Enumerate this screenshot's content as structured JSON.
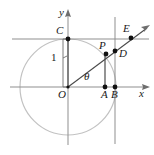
{
  "figure": {
    "kind": "unit-circle-trigonometry-diagram",
    "width": 154,
    "height": 155,
    "background_color": "#ffffff",
    "stroke_color": "#3b3b3b",
    "circle_color": "#bdbdbd",
    "guide_color": "#8c8c8c",
    "point_color": "#1a1a1a"
  },
  "axes": {
    "x_label": "x",
    "y_label": "y",
    "origin_label": "O",
    "origin": {
      "x": 68,
      "y": 87
    },
    "x_axis_y": 87,
    "y_axis_x": 68,
    "x_axis_arrow_tip": {
      "x": 150,
      "y": 87
    },
    "y_axis_arrow_tip": {
      "x": 68,
      "y": 9
    }
  },
  "circle": {
    "center": {
      "x": 68,
      "y": 87
    },
    "radius": 48,
    "radius_label": "1"
  },
  "measure": {
    "label": "1",
    "label_pos": {
      "x": 51,
      "y": 53
    },
    "bracket_x": 63,
    "bracket_top_y": 39,
    "bracket_bottom_y": 87
  },
  "angle": {
    "label": "θ",
    "label_pos": {
      "x": 84,
      "y": 73
    },
    "degrees": 45
  },
  "points": [
    {
      "name": "C",
      "label": "C",
      "x": 68,
      "y": 39,
      "label_pos": {
        "x": 57,
        "y": 26
      }
    },
    {
      "name": "E",
      "label": "E",
      "x": 131,
      "y": 37,
      "label_pos": {
        "x": 124,
        "y": 24
      }
    },
    {
      "name": "P",
      "label": "P",
      "x": 106,
      "y": 54,
      "label_pos": {
        "x": 100,
        "y": 41
      }
    },
    {
      "name": "D",
      "label": "D",
      "x": 115,
      "y": 50,
      "label_pos": {
        "x": 119,
        "y": 49
      }
    },
    {
      "name": "A",
      "label": "A",
      "x": 105,
      "y": 87,
      "label_pos": {
        "x": 101,
        "y": 90
      }
    },
    {
      "name": "B",
      "label": "B",
      "x": 115,
      "y": 87,
      "label_pos": {
        "x": 111,
        "y": 90
      }
    }
  ],
  "lines": {
    "tangent_top": {
      "label": "y = 1 horizontal line",
      "x1": 12,
      "y1": 39,
      "x2": 148,
      "y2": 39
    },
    "tangent_right": {
      "label": "x = 1 vertical line",
      "x1": 115,
      "y1": 18,
      "x2": 115,
      "y2": 143
    },
    "perp_at_A": {
      "label": "vertical segment A to P",
      "x1": 105,
      "y1": 87,
      "x2": 105,
      "y2": 54
    },
    "terminal_ray": {
      "label": "ray O through P D E",
      "x1": 68,
      "y1": 87,
      "x2": 148,
      "y2": 27
    },
    "segment_OC": {
      "label": "segment O to C",
      "x1": 68,
      "y1": 87,
      "x2": 68,
      "y2": 39
    }
  }
}
